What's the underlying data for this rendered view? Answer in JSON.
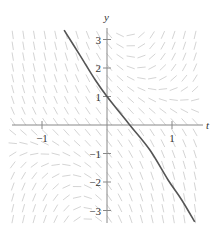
{
  "chart_data": {
    "type": "line",
    "subtype": "slope-field-with-solution-curve",
    "title": "",
    "xlabel": "t",
    "ylabel": "y",
    "xlim": [
      -1.46,
      1.48
    ],
    "ylim": [
      -3.4,
      3.35
    ],
    "x_ticks": [
      {
        "value": -1,
        "label": "−1"
      },
      {
        "value": 1,
        "label": "1"
      }
    ],
    "y_ticks": [
      {
        "value": 3,
        "label": "3"
      },
      {
        "value": 2,
        "label": "2"
      },
      {
        "value": 1,
        "label": "1"
      },
      {
        "value": -1,
        "label": "−1"
      },
      {
        "value": -2,
        "label": "−2"
      },
      {
        "value": -3,
        "label": "−3"
      }
    ],
    "grid": false,
    "legend": null,
    "slope_field": {
      "description": "short line segments indicating slope dy/dt over the grid; steep negative on left, positive tilt upper-right, steep negative lower-right",
      "t_range": [
        -1.45,
        1.45
      ],
      "y_range": [
        -3.3,
        3.3
      ],
      "t_step": 0.165,
      "y_step": 0.38,
      "approx_slope_coefficients": {
        "ty": 3,
        "const": -3
      },
      "color": "#c8c8c8"
    },
    "series": [
      {
        "name": "solution curve through (0, 1)",
        "color": "#555555",
        "points": [
          {
            "t": -0.66,
            "y": 3.33
          },
          {
            "t": -0.42,
            "y": 2.46
          },
          {
            "t": -0.18,
            "y": 1.58
          },
          {
            "t": 0.0,
            "y": 1.0
          },
          {
            "t": 0.35,
            "y": 0.0
          },
          {
            "t": 0.66,
            "y": -0.88
          },
          {
            "t": 0.94,
            "y": -1.93
          },
          {
            "t": 1.15,
            "y": -2.63
          },
          {
            "t": 1.35,
            "y": -3.4
          }
        ]
      }
    ]
  },
  "colors": {
    "axis": "#888888",
    "curve": "#555555",
    "field": "#cfcfcf",
    "text": "#333333"
  }
}
